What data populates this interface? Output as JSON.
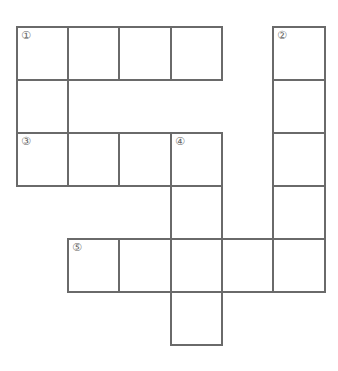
{
  "puzzle": {
    "type": "crossword-grid",
    "border_color": "#6a6a6a",
    "col_edges": [
      17,
      68,
      119,
      171,
      222,
      273,
      325
    ],
    "row_edges": [
      27,
      80,
      133,
      186,
      239,
      292,
      345
    ],
    "cells": [
      {
        "r": 0,
        "c": 0,
        "num": "①"
      },
      {
        "r": 0,
        "c": 1,
        "num": ""
      },
      {
        "r": 0,
        "c": 2,
        "num": ""
      },
      {
        "r": 0,
        "c": 3,
        "num": ""
      },
      {
        "r": 0,
        "c": 5,
        "num": "②"
      },
      {
        "r": 1,
        "c": 0,
        "num": ""
      },
      {
        "r": 1,
        "c": 5,
        "num": ""
      },
      {
        "r": 2,
        "c": 0,
        "num": "③"
      },
      {
        "r": 2,
        "c": 1,
        "num": ""
      },
      {
        "r": 2,
        "c": 2,
        "num": ""
      },
      {
        "r": 2,
        "c": 3,
        "num": "④"
      },
      {
        "r": 2,
        "c": 5,
        "num": ""
      },
      {
        "r": 3,
        "c": 3,
        "num": ""
      },
      {
        "r": 3,
        "c": 5,
        "num": ""
      },
      {
        "r": 4,
        "c": 1,
        "num": "⑤"
      },
      {
        "r": 4,
        "c": 2,
        "num": ""
      },
      {
        "r": 4,
        "c": 3,
        "num": ""
      },
      {
        "r": 4,
        "c": 4,
        "num": ""
      },
      {
        "r": 4,
        "c": 5,
        "num": ""
      },
      {
        "r": 5,
        "c": 3,
        "num": ""
      }
    ],
    "clue_numbers": [
      "①",
      "②",
      "③",
      "④",
      "⑤"
    ]
  }
}
